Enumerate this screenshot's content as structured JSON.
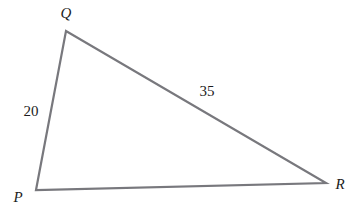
{
  "figure": {
    "type": "triangle-diagram",
    "canvas": {
      "width": 364,
      "height": 214,
      "background": "#ffffff"
    },
    "stroke": {
      "color": "#78787d",
      "width": 2.2
    },
    "vertices": [
      {
        "id": "P",
        "label": "P",
        "x": 36,
        "y": 190,
        "label_x": 18,
        "label_y": 197
      },
      {
        "id": "Q",
        "label": "Q",
        "x": 66,
        "y": 31,
        "label_x": 66,
        "label_y": 13
      },
      {
        "id": "R",
        "label": "R",
        "x": 326,
        "y": 183,
        "label_x": 340,
        "label_y": 184
      }
    ],
    "sides": [
      {
        "id": "PQ",
        "from": "P",
        "to": "Q",
        "label": "20",
        "label_x": 31,
        "label_y": 111
      },
      {
        "id": "QR",
        "from": "Q",
        "to": "R",
        "label": "35",
        "label_x": 207,
        "label_y": 91
      },
      {
        "id": "PR",
        "from": "P",
        "to": "R",
        "label": "",
        "label_x": 0,
        "label_y": 0
      }
    ]
  }
}
